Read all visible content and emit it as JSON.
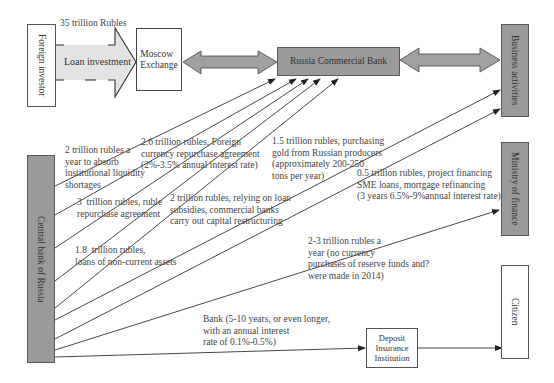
{
  "nodes": {
    "foreign_investor": "Foreign investor",
    "moscow_exchange": "Moscow\nExchange",
    "russia_commercial_bank": "Russia Commercial Bank",
    "business_activities": "Business activities",
    "central_bank": "Central bank of Russia",
    "ministry_of_finance": "Ministry of finance",
    "citizen": "Citizen",
    "deposit_insurance": "Deposit\nInsurance\nInstitution"
  },
  "loan_arrow": {
    "amount": "35 trillion Rubles",
    "label": "Loan investment"
  },
  "flows": [
    {
      "id": "liquidity",
      "text": "2 trillion rubles a\nyear to absorb\ninstitutional liquidity\nshortages"
    },
    {
      "id": "fx_repo",
      "text": "2.6 trillion rubles, Foreign\ncurrency repurchase agreement\n(2%-3.5% annual interest rate)"
    },
    {
      "id": "ruble_repo",
      "text": "3  trillion rubles, ruble\nrepurchase agreement"
    },
    {
      "id": "loan_subsidies",
      "text": "2 trillion rubles, relying on loan\nsubsidies, commercial banks\ncarry out capital restructuring"
    },
    {
      "id": "gold",
      "text": "1.5 trillion rubles, purchasing\ngold from Russian producers\n(approximately 200-250\ntons per year)"
    },
    {
      "id": "project_financing",
      "text": "0.5 trillion rubles, project financing\nSME loans, mortgage refinancing\n(3 years 6.5%-9%annual interest rate)"
    },
    {
      "id": "non_current_assets",
      "text": "1.8  trillion rubles,\nloans of non-current assets"
    },
    {
      "id": "reserve_funds",
      "text": "2-3 trillion rubles a\nyear (no currency\npurchases of reserve funds and?\nwere made in 2014)"
    },
    {
      "id": "deposit_bank",
      "text": "Bank (5-10 years, or even longer,\nwith an annual interest\nrate of 0.1%-0.5%)"
    }
  ],
  "colors": {
    "gray_box": "#9a9a9a",
    "arrow_fill": "#a0a0a0",
    "loan_arrow_fill": "#e3e3e3",
    "line": "#333333"
  }
}
